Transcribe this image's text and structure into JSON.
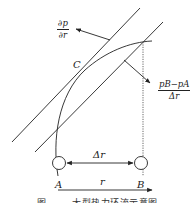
{
  "diagram": {
    "labels": {
      "gradient_num": "∂p",
      "gradient_den": "∂r",
      "point_c": "C",
      "diff_num": "p_B−p_A",
      "diff_num_display": "pB−pA",
      "diff_den": "Δr",
      "delta_r": "Δr",
      "r": "r",
      "point_a": "A",
      "point_b": "B"
    },
    "caption": "图 　　 大型热力环流示意图",
    "colors": {
      "line": "#222222",
      "dotted": "#555555",
      "background": "#ffffff"
    }
  }
}
